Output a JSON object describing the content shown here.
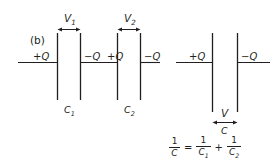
{
  "figure": {
    "panel_label": "(b)",
    "line_color": "#231f20",
    "background_color": "#ffffff"
  },
  "series_circuit": {
    "name": "two-capacitors-in-series",
    "capacitors": [
      {
        "name": "C1",
        "label": "C",
        "label_sub": "1",
        "voltage_label": "V",
        "voltage_sub": "1",
        "left_plate_charge": "+Q",
        "right_plate_charge": "−Q"
      },
      {
        "name": "C2",
        "label": "C",
        "label_sub": "2",
        "voltage_label": "V",
        "voltage_sub": "2",
        "left_plate_charge": "+Q",
        "right_plate_charge": "−Q"
      }
    ]
  },
  "equivalent_circuit": {
    "name": "equivalent-capacitor",
    "capacitor": {
      "label": "C",
      "voltage_label": "V",
      "left_plate_charge": "+Q",
      "right_plate_charge": "−Q"
    }
  },
  "equation": {
    "lhs": {
      "numerator": "1",
      "denominator": "C"
    },
    "equals": "=",
    "term1": {
      "numerator": "1",
      "denominator": "C",
      "denominator_sub": "1"
    },
    "plus": "+",
    "term2": {
      "numerator": "1",
      "denominator": "C",
      "denominator_sub": "2"
    },
    "plain_text": "1/C = 1/C₁ + 1/C₂"
  }
}
